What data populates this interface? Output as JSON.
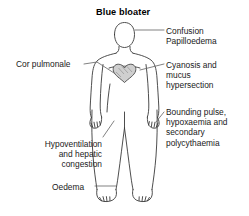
{
  "diagram": {
    "title": "Blue bloater",
    "type": "medical-illustration",
    "colors": {
      "outline": "#3a3a3a",
      "text": "#1a1a1a",
      "leader_line": "#666666",
      "heart_fill": "#cfcfcf",
      "background": "#ffffff"
    },
    "labels": [
      {
        "id": "confusion",
        "side": "right",
        "align": "left",
        "lines": [
          "Confusion",
          "Papilloedema"
        ],
        "text": "Confusion\nPapilloedema",
        "points_to": "head"
      },
      {
        "id": "cyanosis",
        "side": "right",
        "align": "left",
        "lines": [
          "Cyanosis and",
          "mucus",
          "hypersection"
        ],
        "text": "Cyanosis and\nmucus\nhypersection",
        "points_to": "chest"
      },
      {
        "id": "bounding-pulse",
        "side": "right",
        "align": "left",
        "lines": [
          "Bounding pulse,",
          "hypoxaemia and",
          "secondary",
          "polycythaemia"
        ],
        "text": "Bounding pulse,\nhypoxaemia and\nsecondary\npolycythaemia",
        "points_to": "right-hand"
      },
      {
        "id": "cor-pulmonale",
        "side": "left",
        "align": "left",
        "lines": [
          "Cor pulmonale"
        ],
        "text": "Cor pulmonale",
        "points_to": "heart"
      },
      {
        "id": "hypoventilation",
        "side": "left",
        "align": "right",
        "lines": [
          "Hypoventilation",
          "and hepatic",
          "congestion"
        ],
        "text": "Hypoventilation\nand hepatic\ncongestion",
        "points_to": "abdomen"
      },
      {
        "id": "oedema",
        "side": "left",
        "align": "left",
        "lines": [
          "Oedema"
        ],
        "text": "Oedema",
        "points_to": "ankle"
      }
    ]
  }
}
